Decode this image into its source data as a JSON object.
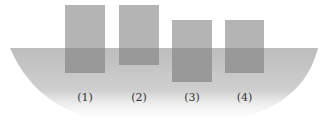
{
  "diagram": {
    "colors": {
      "background": "#ffffff",
      "water": "#c4c4c4",
      "block_above": "#b4b4b4",
      "block_submerged": "#999999",
      "label": "#333333"
    },
    "water_surface_y": 48,
    "blocks": [
      {
        "id": "1",
        "label": "(1)",
        "x": 65,
        "top": 5,
        "width": 40,
        "bottom": 73
      },
      {
        "id": "2",
        "label": "(2)",
        "x": 119,
        "top": 5,
        "width": 40,
        "bottom": 65
      },
      {
        "id": "3",
        "label": "(3)",
        "x": 172,
        "top": 20,
        "width": 40,
        "bottom": 82
      },
      {
        "id": "4",
        "label": "(4)",
        "x": 225,
        "top": 20,
        "width": 39,
        "bottom": 73
      }
    ]
  }
}
